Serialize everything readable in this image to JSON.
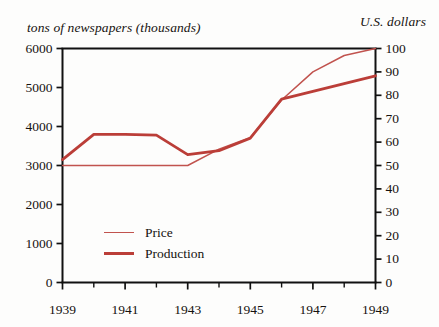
{
  "chart_data": {
    "type": "line",
    "title": "",
    "ylabel": "tons of newspapers (thousands)",
    "ylabel_right": "U.S. dollars",
    "xlabel": "",
    "grid": false,
    "legend_position": "inside-lower-left",
    "x": [
      1939,
      1940,
      1941,
      1942,
      1943,
      1944,
      1945,
      1946,
      1947,
      1948,
      1949
    ],
    "xlim": [
      1939,
      1949
    ],
    "xticks": [
      1939,
      1941,
      1943,
      1945,
      1947,
      1949
    ],
    "xticklabels": [
      "1939",
      "1941",
      "1943",
      "1945",
      "1947",
      "1949"
    ],
    "xminorticks": [
      1940,
      1942,
      1944,
      1946,
      1948
    ],
    "ylim": [
      0,
      6000
    ],
    "yticks": [
      0,
      1000,
      2000,
      3000,
      4000,
      5000,
      6000
    ],
    "yticklabels": [
      "0",
      "1000",
      "2000",
      "3000",
      "4000",
      "5000",
      "6000"
    ],
    "ylim_right": [
      0,
      100
    ],
    "yticks_right": [
      0,
      10,
      20,
      30,
      40,
      50,
      60,
      70,
      80,
      90,
      100
    ],
    "yticklabels_right": [
      "0",
      "10",
      "20",
      "30",
      "40",
      "50",
      "60",
      "70",
      "80",
      "90",
      "100"
    ],
    "series": [
      {
        "name": "Price",
        "axis": "right",
        "color": "#c1534e",
        "linewidth": 1.5,
        "values": [
          50,
          50,
          50,
          50,
          50,
          57,
          62,
          78,
          90,
          97,
          100
        ]
      },
      {
        "name": "Production",
        "axis": "left",
        "color": "#bb3e38",
        "linewidth": 2.8,
        "values": [
          3150,
          3800,
          3800,
          3780,
          3280,
          3380,
          3700,
          4700,
          4900,
          5100,
          5300
        ]
      }
    ]
  },
  "legend": {
    "items": [
      {
        "label": "Price"
      },
      {
        "label": "Production"
      }
    ]
  },
  "colors": {
    "price": "#c1534e",
    "production": "#bb3e38",
    "axis": "#111111",
    "text": "#16120f",
    "background": "#fdfdfc"
  }
}
